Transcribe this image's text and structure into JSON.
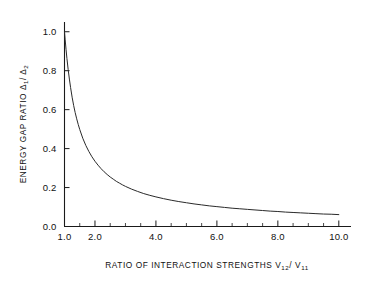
{
  "chart_data": {
    "type": "line",
    "title": "",
    "xlabel": "RATIO OF INTERACTION STRENGTHS",
    "xlabel_symbol_num": "V",
    "xlabel_symbol_num_sub": "12",
    "xlabel_symbol_sep": "/",
    "xlabel_symbol_den": "V",
    "xlabel_symbol_den_sub": "11",
    "ylabel": "ENERGY GAP RATIO",
    "ylabel_symbol_num": "Δ",
    "ylabel_symbol_num_sub": "1",
    "ylabel_symbol_sep": "/",
    "ylabel_symbol_den": "Δ",
    "ylabel_symbol_den_sub": "2",
    "xlim": [
      1.0,
      10.4
    ],
    "ylim": [
      0.0,
      1.05
    ],
    "grid": false,
    "legend": null,
    "xticks": [
      1.0,
      2.0,
      4.0,
      6.0,
      8.0,
      10.0
    ],
    "xticklabels": [
      "1.0",
      "2.0",
      "4.0",
      "6.0",
      "8.0",
      "10.0"
    ],
    "xminorticks": [
      1.5,
      2.5,
      3.0,
      3.5,
      4.5,
      5.0,
      5.5,
      6.5,
      7.0,
      7.5,
      8.5,
      9.0,
      9.5
    ],
    "yticks": [
      0.0,
      0.2,
      0.4,
      0.6,
      0.8,
      1.0
    ],
    "yticklabels": [
      "0.0",
      "0.2",
      "0.4",
      "0.6",
      "0.8",
      "1.0"
    ],
    "series": [
      {
        "name": "energy gap ratio",
        "color": "#2a2a2a",
        "x": [
          1.0,
          1.02,
          1.05,
          1.08,
          1.12,
          1.16,
          1.2,
          1.25,
          1.3,
          1.35,
          1.4,
          1.45,
          1.5,
          1.6,
          1.7,
          1.8,
          1.9,
          2.0,
          2.1,
          2.2,
          2.3,
          2.4,
          2.5,
          2.6,
          2.7,
          2.8,
          2.9,
          3.0,
          3.2,
          3.4,
          3.6,
          3.8,
          4.0,
          4.25,
          4.5,
          4.75,
          5.0,
          5.25,
          5.5,
          5.75,
          6.0,
          6.25,
          6.5,
          6.75,
          7.0,
          7.25,
          7.5,
          7.75,
          8.0,
          8.25,
          8.5,
          8.75,
          9.0,
          9.25,
          9.5,
          9.75,
          10.0
        ],
        "y": [
          1.0,
          0.962,
          0.91,
          0.862,
          0.806,
          0.757,
          0.713,
          0.664,
          0.622,
          0.585,
          0.553,
          0.524,
          0.498,
          0.453,
          0.416,
          0.385,
          0.358,
          0.335,
          0.315,
          0.297,
          0.281,
          0.267,
          0.254,
          0.243,
          0.232,
          0.223,
          0.214,
          0.206,
          0.192,
          0.18,
          0.169,
          0.16,
          0.152,
          0.143,
          0.135,
          0.128,
          0.122,
          0.116,
          0.111,
          0.106,
          0.102,
          0.098,
          0.094,
          0.091,
          0.088,
          0.085,
          0.082,
          0.079,
          0.077,
          0.074,
          0.072,
          0.07,
          0.068,
          0.066,
          0.064,
          0.063,
          0.061
        ]
      }
    ]
  }
}
